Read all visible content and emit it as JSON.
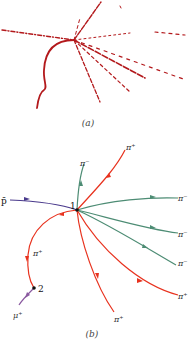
{
  "panel_a": {
    "caption": "(a)",
    "description": "bubble chamber photograph of particle tracks",
    "track_color": "#b3191c"
  },
  "panel_b": {
    "caption": "(b)",
    "vertex_1_label": "1",
    "vertex_2_label": "2",
    "incoming_particle": "p̄",
    "labels": {
      "pi_minus_top": "π⁻",
      "pi_plus_top": "π⁺",
      "pi_minus_right_1": "π⁻",
      "pi_minus_right_2": "π⁻",
      "pi_minus_right_3": "π⁻",
      "pi_plus_right": "π⁺",
      "pi_plus_bottom": "π⁺",
      "pi_plus_left": "π⁺",
      "mu_plus": "μ⁺"
    },
    "colors": {
      "positive": "#e8321e",
      "negative": "#4d8c74",
      "antiproton": "#4a3a8c",
      "muon": "#8a5aa0"
    }
  }
}
